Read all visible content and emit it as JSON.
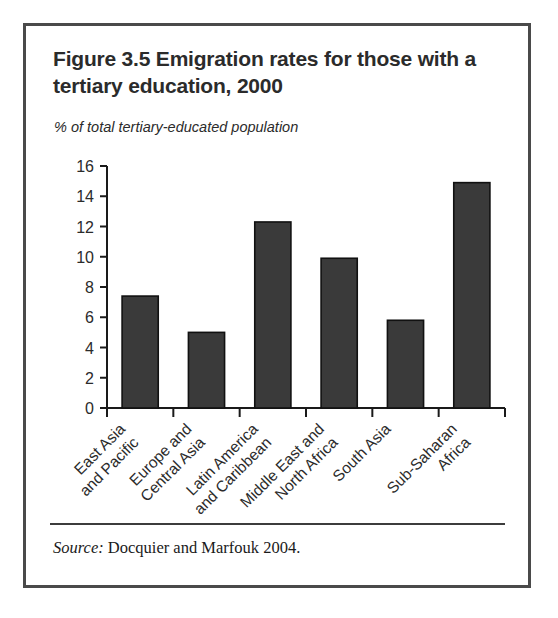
{
  "figure": {
    "title": "Figure 3.5  Emigration rates for those with a tertiary education, 2000",
    "subtitle": "% of total tertiary-educated population",
    "source_label": "Source:",
    "source_text": " Docquier and Marfouk 2004."
  },
  "colors": {
    "bar_fill": "#3a3a3a",
    "bar_stroke": "#111111",
    "axis": "#1a1a1a",
    "frame": "#4a4a4a",
    "text": "#2b2b2b",
    "background": "#ffffff"
  },
  "chart_data": {
    "type": "bar",
    "title": "Figure 3.5  Emigration rates for those with a tertiary education, 2000",
    "subtitle": "% of total tertiary-educated population",
    "xlabel": "",
    "ylabel": "% of total tertiary-educated population",
    "ylim": [
      0,
      16
    ],
    "yticks": [
      0,
      2,
      4,
      6,
      8,
      10,
      12,
      14,
      16
    ],
    "ytick_labels": [
      "0",
      "2",
      "4",
      "6",
      "8",
      "10",
      "12",
      "14",
      "16"
    ],
    "grid": false,
    "legend": false,
    "categories": [
      "East Asia and Pacific",
      "Europe and Central Asia",
      "Latin America and Caribbean",
      "Middle East and North Africa",
      "South Asia",
      "Sub-Saharan Africa"
    ],
    "category_lines": [
      [
        "East Asia",
        "and Pacific"
      ],
      [
        "Europe and",
        "Central Asia"
      ],
      [
        "Latin America",
        "and Caribbean"
      ],
      [
        "Middle East and",
        "North Africa"
      ],
      [
        "South Asia",
        ""
      ],
      [
        "Sub-Saharan",
        "Africa"
      ]
    ],
    "values": [
      7.4,
      5.0,
      12.3,
      9.9,
      5.8,
      14.9
    ],
    "tick_label_rotation_deg": -45,
    "source": "Source: Docquier and Marfouk 2004."
  }
}
